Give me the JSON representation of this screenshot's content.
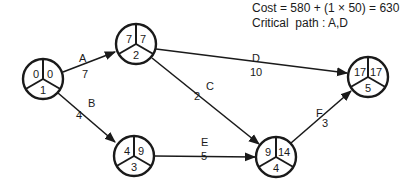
{
  "info": {
    "cost_line": "Cost = 580 + (1 × 50) = 630",
    "critical_path_line": "Critical  path : A,D"
  },
  "nodes": [
    {
      "id": "1",
      "earliest": "0",
      "latest": "0",
      "cx": 43,
      "cy": 79
    },
    {
      "id": "2",
      "earliest": "7",
      "latest": "7",
      "cx": 136,
      "cy": 44
    },
    {
      "id": "3",
      "earliest": "4",
      "latest": "9",
      "cx": 134,
      "cy": 156
    },
    {
      "id": "4",
      "earliest": "9",
      "latest": "14",
      "cx": 276,
      "cy": 157
    },
    {
      "id": "5",
      "earliest": "17",
      "latest": "17",
      "cx": 368,
      "cy": 77
    }
  ],
  "edges": [
    {
      "activity": "A",
      "duration": "7",
      "from": "1",
      "to": "2"
    },
    {
      "activity": "B",
      "duration": "4",
      "from": "1",
      "to": "3"
    },
    {
      "activity": "C",
      "duration": "2",
      "from": "2",
      "to": "4"
    },
    {
      "activity": "D",
      "duration": "10",
      "from": "2",
      "to": "5"
    },
    {
      "activity": "E",
      "duration": "5",
      "from": "3",
      "to": "4"
    },
    {
      "activity": "F",
      "duration": "3",
      "from": "4",
      "to": "5"
    }
  ],
  "colors": {
    "stroke": "#1a1a1a",
    "background": "#ffffff"
  }
}
